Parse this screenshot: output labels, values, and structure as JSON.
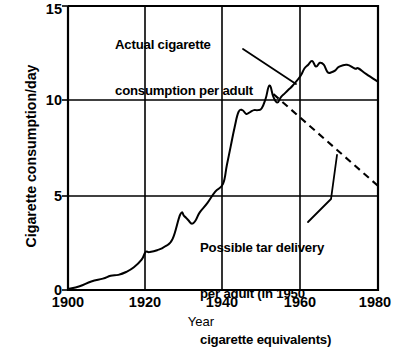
{
  "chart_data": {
    "type": "line",
    "title": "",
    "xlabel": "Year",
    "ylabel": "Cigarette consumption/day",
    "xlim": [
      1900,
      1980
    ],
    "ylim": [
      0,
      15
    ],
    "xticks": [
      1900,
      1920,
      1940,
      1960,
      1980
    ],
    "yticks": [
      0,
      5,
      10,
      15
    ],
    "xtick_labels": [
      "1900",
      "1920",
      "1940",
      "1960",
      "1980"
    ],
    "ytick_labels": [
      "0",
      "5",
      "10",
      "15"
    ],
    "grid": true,
    "legend_position": "inline-annotations",
    "line_color": "#000000",
    "series": [
      {
        "name": "Actual cigarette consumption per adult",
        "style": "solid",
        "x": [
          1900,
          1903,
          1906,
          1909,
          1911,
          1913,
          1915,
          1917,
          1919,
          1920,
          1921,
          1923,
          1925,
          1927,
          1929,
          1930,
          1931,
          1932,
          1933,
          1934,
          1936,
          1938,
          1940,
          1941,
          1942,
          1943,
          1944,
          1945,
          1946,
          1947,
          1948,
          1949,
          1950,
          1951,
          1952,
          1953,
          1954,
          1955,
          1956,
          1957,
          1958,
          1960,
          1961,
          1962,
          1963,
          1964,
          1965,
          1966,
          1967,
          1968,
          1969,
          1970,
          1972,
          1974,
          1975,
          1977,
          1980
        ],
        "y": [
          0.05,
          0.2,
          0.45,
          0.6,
          0.75,
          0.8,
          0.95,
          1.2,
          1.6,
          2.0,
          2.0,
          2.1,
          2.3,
          2.7,
          4.0,
          3.9,
          3.7,
          3.5,
          3.7,
          4.1,
          4.6,
          5.2,
          5.6,
          6.6,
          7.6,
          8.6,
          9.4,
          9.5,
          9.3,
          9.4,
          9.5,
          9.5,
          9.6,
          10.1,
          10.8,
          10.2,
          9.9,
          10.2,
          10.4,
          10.6,
          10.8,
          11.3,
          11.7,
          11.9,
          12.1,
          11.8,
          12.0,
          11.9,
          11.5,
          11.5,
          11.6,
          11.8,
          11.9,
          11.7,
          11.7,
          11.4,
          11.0
        ]
      },
      {
        "name": "Possible tar delivery per adult (in 1950 cigarette equivalents)",
        "style": "dashed",
        "x": [
          1953,
          1980
        ],
        "y": [
          10.35,
          5.5
        ]
      }
    ],
    "annotations": [
      {
        "name": "actual-consumption-label",
        "text": "Actual cigarette\nconsumption per adult",
        "line1": "Actual cigarette",
        "line2": "consumption per adult"
      },
      {
        "name": "tar-delivery-label",
        "text": "Possible tar delivery\nper adult (in 1950\ncigarette equivalents)",
        "line1": "Possible tar delivery",
        "line2": "per adult (in 1950",
        "line3": "cigarette equivalents)"
      }
    ]
  },
  "axis": {
    "y_title": "Cigarette consumption/day",
    "x_title": "Year",
    "ytick_0": "0",
    "ytick_1": "5",
    "ytick_2": "10",
    "ytick_3": "15",
    "xtick_0": "1900",
    "xtick_1": "1920",
    "xtick_2": "1940",
    "xtick_3": "1960",
    "xtick_4": "1980"
  },
  "annotations": {
    "actual_line1": "Actual cigarette",
    "actual_line2": "consumption per adult",
    "tar_line1": "Possible tar delivery",
    "tar_line2": "per adult (in 1950",
    "tar_line3": "cigarette equivalents)"
  }
}
